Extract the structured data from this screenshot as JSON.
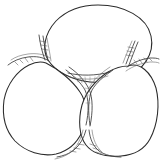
{
  "figure": {
    "title": "Three adjoining cells with intercellular junctions",
    "type": "line-drawing",
    "background_color": "#ffffff",
    "outline_color": "#2b2b2b",
    "channel_color": "#3a3a3a",
    "hatch_color": "#4a4a4a",
    "canvas": {
      "width": 163,
      "height": 164
    }
  },
  "cells": [
    {
      "id": "cell-top",
      "label": "top cell",
      "shape": "ellipse",
      "center_x": 98,
      "center_y": 47,
      "radius_x": 54,
      "radius_y": 42
    },
    {
      "id": "cell-bottom-left",
      "label": "bottom left cell",
      "shape": "rounded-triangle",
      "center_x": 52,
      "center_y": 110,
      "radius_x": 49,
      "radius_y": 47
    },
    {
      "id": "cell-bottom-right",
      "label": "bottom right cell",
      "shape": "rounded-blob",
      "center_x": 113,
      "center_y": 112,
      "radius_x": 46,
      "radius_y": 45
    }
  ],
  "junctions": [
    {
      "id": "junction-left",
      "label": "left tricellular junction",
      "x": 38,
      "y": 57,
      "hatch_marks": 7
    },
    {
      "id": "junction-right",
      "label": "right tricellular junction",
      "x": 134,
      "y": 58,
      "hatch_marks": 7
    },
    {
      "id": "junction-bottom",
      "label": "bottom tricellular junction",
      "x": 78,
      "y": 148,
      "hatch_marks": 6
    },
    {
      "id": "junction-center",
      "label": "central intercellular space",
      "x": 84,
      "y": 88,
      "hatch_marks": 9
    }
  ],
  "channels": [
    {
      "id": "channel-upper-left",
      "label": "upper left intercellular channel"
    },
    {
      "id": "channel-upper-right",
      "label": "upper right intercellular channel"
    },
    {
      "id": "channel-lower-center",
      "label": "lower central intercellular channel"
    }
  ]
}
